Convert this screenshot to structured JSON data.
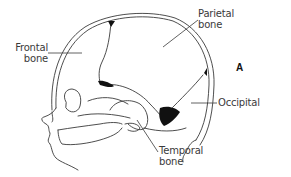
{
  "figure": {
    "panel_letter": "A",
    "labels": {
      "frontal": {
        "line1": "Frontal",
        "line2": "bone"
      },
      "parietal": {
        "line1": "Parietal",
        "line2": "bone"
      },
      "occipital": {
        "line1": "Occipital"
      },
      "temporal": {
        "line1": "Temporal",
        "line2": "bone"
      }
    },
    "colors": {
      "line": "#3a3a3a",
      "fontanelle_fill": "#111111",
      "background": "#ffffff"
    }
  }
}
